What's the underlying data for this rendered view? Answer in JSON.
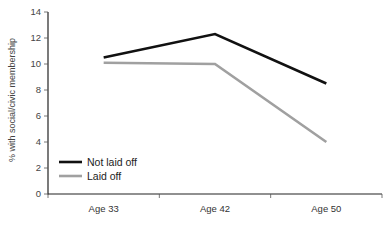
{
  "chart_data": {
    "type": "line",
    "title": "",
    "xlabel": "",
    "ylabel": "% with social/civic membership",
    "categories": [
      "Age 33",
      "Age 42",
      "Age 50"
    ],
    "series": [
      {
        "name": "Not laid off",
        "color": "#111111",
        "values": [
          10.5,
          12.3,
          8.5
        ]
      },
      {
        "name": "Laid off",
        "color": "#a0a0a0",
        "values": [
          10.1,
          10.0,
          4.0
        ]
      }
    ],
    "ylim": [
      0,
      14
    ],
    "yticks": [
      0,
      2,
      4,
      6,
      8,
      10,
      12,
      14
    ],
    "grid": false,
    "legend_position": "lower-left"
  }
}
